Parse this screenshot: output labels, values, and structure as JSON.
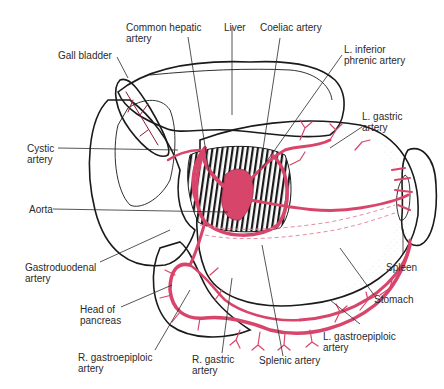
{
  "diagram": {
    "colors": {
      "artery": "#d8456a",
      "artery_dark": "#8c1a36",
      "outline": "#1a1a1a",
      "label": "#2a2a2a",
      "background": "#ffffff"
    },
    "labels": {
      "common_hepatic_artery": "Common hepatic\nartery",
      "liver": "Liver",
      "coeliac_artery": "Coeliac artery",
      "gall_bladder": "Gall bladder",
      "l_inferior_phrenic_artery": "L. inferior\nphrenic artery",
      "l_gastric_artery": "L. gastric\nartery",
      "cystic_artery": "Cystic\nartery",
      "aorta": "Aorta",
      "gastroduodenal_artery": "Gastroduodenal\nartery",
      "spleen": "Spleen",
      "stomach": "Stomach",
      "head_of_pancreas": "Head of\npancreas",
      "l_gastroepiploic_artery": "L. gastroepiploic\nartery",
      "r_gastroepiploic_artery": "R. gastroepiploic\nartery",
      "r_gastric_artery": "R. gastric\nartery",
      "splenic_artery": "Splenic artery"
    }
  }
}
